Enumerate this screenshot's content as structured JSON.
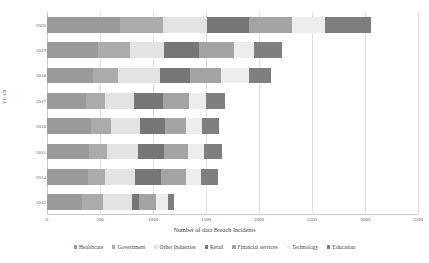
{
  "chart_data": {
    "type": "bar",
    "orientation": "horizontal",
    "stacked": true,
    "title": "",
    "xlabel": "Number of data Breach Incidents",
    "ylabel": "YEAR",
    "xlim": [
      0,
      3500
    ],
    "xticks": [
      0,
      500,
      1000,
      1500,
      2000,
      2500,
      3000,
      3500
    ],
    "xtick_labels": [
      "0",
      "500",
      "1000",
      "1500",
      "2000",
      "2500",
      "3000",
      "3500"
    ],
    "grid": true,
    "legend_position": "bottom",
    "categories": [
      "2020",
      "2019",
      "2018",
      "2017",
      "2016",
      "2015",
      "2014",
      "2013"
    ],
    "series": [
      {
        "name": "Healthcare",
        "color": "#9a9a9a",
        "values": [
          690,
          480,
          430,
          370,
          415,
          400,
          390,
          330
        ]
      },
      {
        "name": "Government",
        "color": "#ababab",
        "values": [
          400,
          300,
          240,
          180,
          190,
          165,
          160,
          200
        ]
      },
      {
        "name": "Other Industries",
        "color": "#e3e3e3",
        "values": [
          420,
          320,
          400,
          270,
          275,
          290,
          280,
          270
        ]
      },
      {
        "name": "Retail",
        "color": "#767676",
        "values": [
          400,
          330,
          280,
          270,
          230,
          250,
          250,
          70
        ]
      },
      {
        "name": "Financial services",
        "color": "#a4a4a4",
        "values": [
          400,
          330,
          290,
          250,
          200,
          230,
          230,
          160
        ]
      },
      {
        "name": "Technology",
        "color": "#ededed",
        "values": [
          310,
          190,
          270,
          160,
          155,
          145,
          140,
          110
        ]
      },
      {
        "name": "Education",
        "color": "#7f7f7f",
        "values": [
          440,
          270,
          200,
          180,
          160,
          170,
          160,
          60
        ]
      }
    ],
    "totals": [
      3060,
      2220,
      2110,
      1680,
      1625,
      1650,
      1610,
      1200
    ]
  },
  "legend": {
    "items": [
      "Healthcare",
      "Government",
      "Other Industries",
      "Retail",
      "Financial services",
      "Technology",
      "Education"
    ]
  }
}
